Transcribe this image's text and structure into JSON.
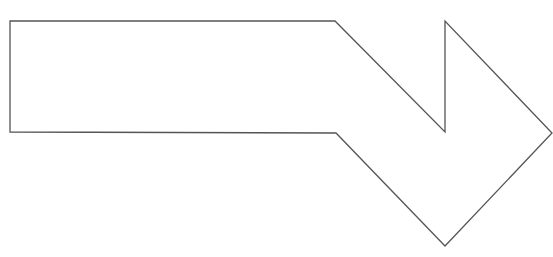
{
  "diagram": {
    "type": "bent-arrow-outline",
    "width": 553,
    "height": 257,
    "shape": {
      "name": "bent-down-right-arrow",
      "fill": "#ffffff",
      "stroke": "#555555",
      "stroke_width": 1.3,
      "points": [
        [
          10,
          21
        ],
        [
          335,
          21
        ],
        [
          445,
          132
        ],
        [
          445,
          21
        ],
        [
          552,
          133
        ],
        [
          445,
          246
        ],
        [
          336,
          133
        ],
        [
          10,
          132
        ]
      ]
    }
  }
}
